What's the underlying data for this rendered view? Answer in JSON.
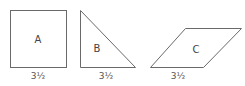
{
  "shapes": [
    {
      "id": "A",
      "type": "square",
      "label": "A",
      "base_label": "3½"
    },
    {
      "id": "B",
      "type": "right-triangle",
      "label": "B",
      "base_label": "3½"
    },
    {
      "id": "C",
      "type": "parallelogram",
      "label": "C",
      "base_label": "3½"
    }
  ],
  "colors": {
    "stroke": "#6a6a6a",
    "text": "#444444"
  }
}
